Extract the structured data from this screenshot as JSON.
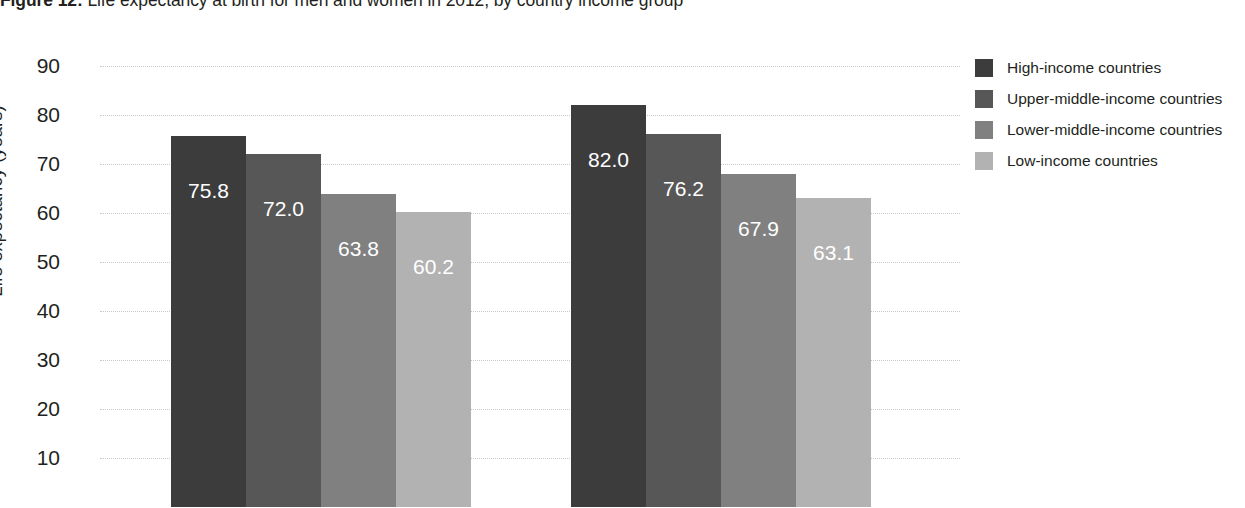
{
  "title": {
    "label": "Figure 12:",
    "caption": " Life expectancy at birth for men and women in 2012, by country income group"
  },
  "chart_data": {
    "type": "bar",
    "title": "Figure 12: Life expectancy at birth for men and women in 2012, by country income group",
    "xlabel": "",
    "ylabel": "Life expectancy (years)",
    "ylim": [
      0,
      90
    ],
    "ytick_labels": [
      "90",
      "80",
      "70",
      "60",
      "50",
      "40",
      "30",
      "20",
      "10"
    ],
    "ytick_values": [
      90,
      80,
      70,
      60,
      50,
      40,
      30,
      20,
      10
    ],
    "grid": true,
    "legend_position": "right",
    "categories": [
      "Men",
      "Women"
    ],
    "series": [
      {
        "name": "High-income countries",
        "color": "#3c3c3c",
        "values": [
          75.8,
          82.0
        ]
      },
      {
        "name": "Upper-middle-income countries",
        "color": "#575757",
        "values": [
          72.0,
          76.2
        ]
      },
      {
        "name": "Lower-middle-income countries",
        "color": "#808080",
        "values": [
          63.8,
          67.9
        ]
      },
      {
        "name": "Low-income countries",
        "color": "#b2b2b2",
        "values": [
          60.2,
          63.1
        ]
      }
    ],
    "bar_labels": [
      [
        "75.8",
        "72.0",
        "63.8",
        "60.2"
      ],
      [
        "82.0",
        "76.2",
        "67.9",
        "63.1"
      ]
    ]
  },
  "legend": {
    "items": [
      {
        "label": "High-income countries",
        "color": "#3c3c3c"
      },
      {
        "label": "Upper-middle-income countries",
        "color": "#575757"
      },
      {
        "label": "Lower-middle-income countries",
        "color": "#808080"
      },
      {
        "label": "Low-income countries",
        "color": "#b2b2b2"
      }
    ]
  }
}
